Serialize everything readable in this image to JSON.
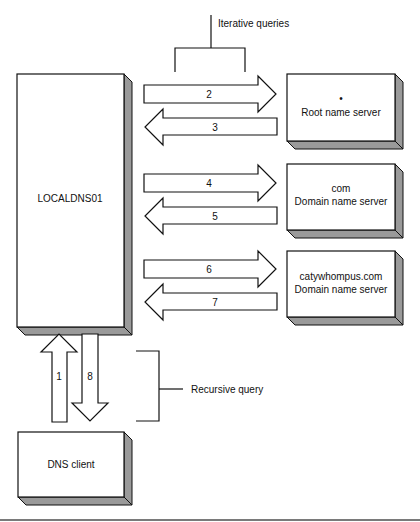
{
  "diagram": {
    "colors": {
      "stroke": "#111111",
      "box_face": "#ffffff",
      "box_shadow": "#9a9a9a",
      "background": "#ffffff"
    },
    "nodes": {
      "local_dns": {
        "label": "LOCALDNS01"
      },
      "root_server": {
        "dot": "•",
        "label": "Root name server"
      },
      "com_server": {
        "line1": "com",
        "line2": "Domain name server"
      },
      "catywhompus_server": {
        "line1": "catywhompus.com",
        "line2": "Domain name server"
      },
      "dns_client": {
        "label": "DNS client"
      }
    },
    "arrows": [
      {
        "step": "1",
        "from": "DNS client",
        "to": "LOCALDNS01",
        "direction": "up"
      },
      {
        "step": "2",
        "from": "LOCALDNS01",
        "to": "Root name server",
        "direction": "right"
      },
      {
        "step": "3",
        "from": "Root name server",
        "to": "LOCALDNS01",
        "direction": "left"
      },
      {
        "step": "4",
        "from": "LOCALDNS01",
        "to": "com Domain name server",
        "direction": "right"
      },
      {
        "step": "5",
        "from": "com Domain name server",
        "to": "LOCALDNS01",
        "direction": "left"
      },
      {
        "step": "6",
        "from": "LOCALDNS01",
        "to": "catywhompus.com Domain name server",
        "direction": "right"
      },
      {
        "step": "7",
        "from": "catywhompus.com Domain name server",
        "to": "LOCALDNS01",
        "direction": "left"
      },
      {
        "step": "8",
        "from": "LOCALDNS01",
        "to": "DNS client",
        "direction": "down"
      }
    ],
    "annotations": {
      "iterative": "Iterative queries",
      "recursive": "Recursive query"
    }
  }
}
